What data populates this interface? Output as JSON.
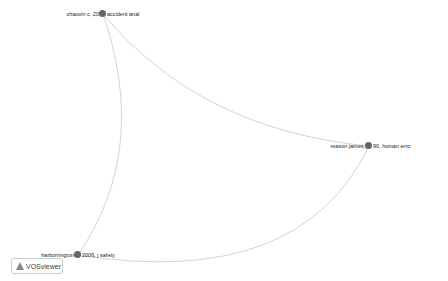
{
  "network": {
    "nodes": [
      {
        "id": "chauvin",
        "label_left": "chauvin c, 20",
        "label_right": " accident anal",
        "x": 103,
        "y": 14
      },
      {
        "id": "reason",
        "label_left": "reason james, ",
        "label_right": "90, human erro",
        "x": 369,
        "y": 146
      },
      {
        "id": "harb",
        "label_left": "harborrington",
        "label_right": " 2006, j safety",
        "x": 78,
        "y": 255
      }
    ],
    "edges": [
      [
        "chauvin",
        "reason"
      ],
      [
        "chauvin",
        "harb"
      ],
      [
        "harb",
        "reason"
      ]
    ]
  },
  "logo": {
    "text": "VOSviewer"
  }
}
